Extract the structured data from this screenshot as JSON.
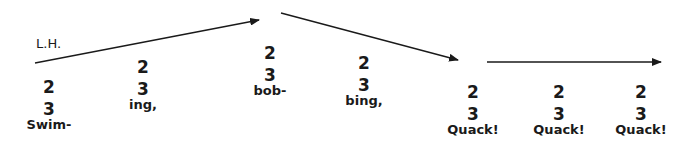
{
  "hand_label": "L.H.",
  "colors": {
    "ink": "#1a1a1a",
    "background": "#ffffff"
  },
  "arrows": [
    {
      "x1": 35,
      "y1": 63,
      "x2": 259,
      "y2": 20,
      "head": true
    },
    {
      "x1": 281,
      "y1": 13,
      "x2": 458,
      "y2": 60,
      "head": true
    },
    {
      "x1": 487,
      "y1": 62,
      "x2": 661,
      "y2": 62,
      "head": true
    }
  ],
  "syllables": [
    {
      "top": "2",
      "bottom": "3",
      "word": "Swim-",
      "x": 49,
      "y": 76
    },
    {
      "top": "2",
      "bottom": "3",
      "word": "ing,",
      "x": 143,
      "y": 56
    },
    {
      "top": "2",
      "bottom": "3",
      "word": "bob-",
      "x": 270,
      "y": 42
    },
    {
      "top": "2",
      "bottom": "3",
      "word": "bing,",
      "x": 364,
      "y": 52
    },
    {
      "top": "2",
      "bottom": "3",
      "word": "Quack!",
      "x": 473,
      "y": 81
    },
    {
      "top": "2",
      "bottom": "3",
      "word": "Quack!",
      "x": 559,
      "y": 81
    },
    {
      "top": "2",
      "bottom": "3",
      "word": "Quack!",
      "x": 641,
      "y": 81
    }
  ]
}
